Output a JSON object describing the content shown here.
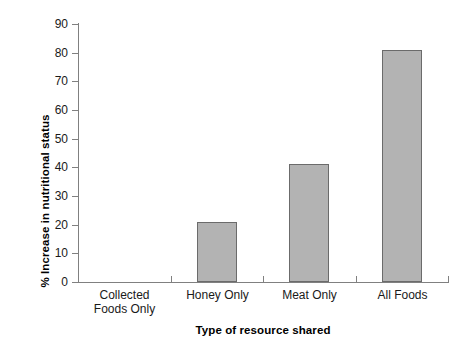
{
  "chart_data": {
    "type": "bar",
    "title": "",
    "subtitle": "",
    "xlabel": "Type of resource shared",
    "ylabel": "% Increase in nutritional status",
    "categories": [
      "Collected Foods Only",
      "Honey Only",
      "Meat Only",
      "All Foods"
    ],
    "category_labels_multiline": [
      "Collected\nFoods Only",
      "Honey Only",
      "Meat Only",
      "All Foods"
    ],
    "values": [
      0,
      21,
      41,
      81
    ],
    "ylim": [
      0,
      90
    ],
    "ytick_values": [
      0,
      10,
      20,
      30,
      40,
      50,
      60,
      70,
      80,
      90
    ],
    "ytick_labels": [
      "0",
      "10",
      "20",
      "30",
      "40",
      "50",
      "60",
      "70",
      "80",
      "90"
    ],
    "grid": false,
    "legend": false,
    "legend_position": "none",
    "bar_fill_color": "#b3b3b3",
    "bar_edge_color": "#6b6b6b",
    "axis_color": "#808080",
    "text_color": "#1a1a1a"
  }
}
